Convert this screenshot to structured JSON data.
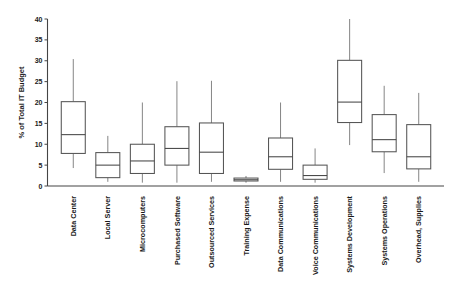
{
  "chart_data": {
    "type": "box",
    "title": "",
    "xlabel": "",
    "ylabel": "% of Total IT Budget",
    "ylim": [
      0,
      40
    ],
    "yticks": [
      0,
      5,
      10,
      15,
      20,
      25,
      30,
      35,
      40
    ],
    "ytick_labels": [
      "0",
      "5",
      "10",
      "15",
      "20",
      "25",
      "30",
      "35",
      "40"
    ],
    "grid": false,
    "legend": "none",
    "axis_color": "#444444",
    "box_fill": "#ffffff",
    "box_stroke": "#555555",
    "whisker_stroke": "#777777",
    "categories": [
      "Data Center",
      "Local Server",
      "Microcomputers",
      "Purchased Software",
      "Outsourced Services",
      "Training Expense",
      "Data Communications",
      "Voice Communications",
      "Systems Development",
      "Systems Operations",
      "Overhead, Supplies"
    ],
    "boxes": [
      {
        "category": "Data Center",
        "whisker_low": 4.3,
        "q1": 7.8,
        "median": 12.3,
        "q3": 20.2,
        "whisker_high": 30.4
      },
      {
        "category": "Local Server",
        "whisker_low": 1.0,
        "q1": 2.0,
        "median": 5.0,
        "q3": 8.0,
        "whisker_high": 12.0
      },
      {
        "category": "Microcomputers",
        "whisker_low": 0.8,
        "q1": 3.0,
        "median": 6.0,
        "q3": 10.0,
        "whisker_high": 20.0
      },
      {
        "category": "Purchased Software",
        "whisker_low": 0.8,
        "q1": 5.0,
        "median": 9.0,
        "q3": 14.2,
        "whisker_high": 25.1
      },
      {
        "category": "Outsourced Services",
        "whisker_low": 1.0,
        "q1": 3.0,
        "median": 8.1,
        "q3": 15.1,
        "whisker_high": 25.2
      },
      {
        "category": "Training Expense",
        "whisker_low": 0.8,
        "q1": 1.2,
        "median": 1.5,
        "q3": 1.9,
        "whisker_high": 2.4
      },
      {
        "category": "Data Communications",
        "whisker_low": 1.0,
        "q1": 4.0,
        "median": 7.0,
        "q3": 11.5,
        "whisker_high": 20.0
      },
      {
        "category": "Voice Communications",
        "whisker_low": 0.8,
        "q1": 1.6,
        "median": 2.5,
        "q3": 5.0,
        "whisker_high": 9.0
      },
      {
        "category": "Systems Development",
        "whisker_low": 9.8,
        "q1": 15.2,
        "median": 20.1,
        "q3": 30.1,
        "whisker_high": 40.0
      },
      {
        "category": "Systems Operations",
        "whisker_low": 3.1,
        "q1": 8.2,
        "median": 11.1,
        "q3": 17.1,
        "whisker_high": 24.0
      },
      {
        "category": "Overhead, Supplies",
        "whisker_low": 1.0,
        "q1": 4.1,
        "median": 7.0,
        "q3": 14.7,
        "whisker_high": 22.3
      }
    ]
  }
}
